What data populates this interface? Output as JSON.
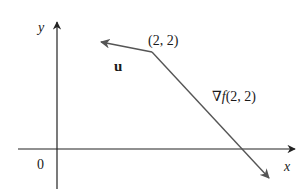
{
  "diagram": {
    "title": "",
    "axes": {
      "x_label": "x",
      "y_label": "y",
      "origin_label": "0"
    },
    "point": {
      "label": "(2, 2)",
      "coords": [
        2,
        2
      ]
    },
    "vectors": [
      {
        "name": "u",
        "label": "u",
        "from": "(2, 2)",
        "direction": "up-left"
      },
      {
        "name": "gradient",
        "label_prefix": "∇",
        "label_f": "f",
        "label_args": "(2, 2)",
        "from": "(2, 2)",
        "direction": "down-right"
      }
    ],
    "colors": {
      "axis": "#222222",
      "vector": "#555555",
      "text": "#1a1a1a",
      "background": "#ffffff"
    }
  }
}
